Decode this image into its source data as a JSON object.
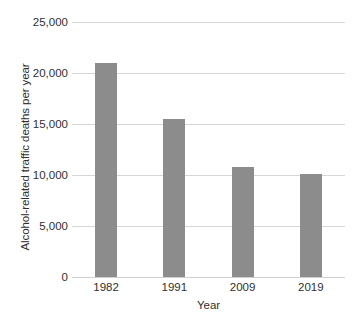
{
  "chart_data": {
    "type": "bar",
    "title": "",
    "subtitle": "",
    "xlabel": "Year",
    "ylabel": "Alcohol-related traffic deaths per year",
    "categories": [
      "1982",
      "1991",
      "2009",
      "2019"
    ],
    "values": [
      21000,
      15500,
      10800,
      10100
    ],
    "series": [
      {
        "name": "Alcohol-related traffic deaths per year",
        "values": [
          21000,
          15500,
          10800,
          10100
        ]
      }
    ],
    "ylim": [
      0,
      25000
    ],
    "ytick_values": [
      0,
      5000,
      10000,
      15000,
      20000,
      25000
    ],
    "ytick_labels": [
      "0",
      "5,000",
      "10,000",
      "15,000",
      "20,000",
      "25,000"
    ],
    "xtick_labels": [
      "1982",
      "1991",
      "2009",
      "2019"
    ],
    "grid": true,
    "grid_axis": "y",
    "legend": false,
    "legend_position": "none",
    "bar_color": "#8c8c8c",
    "gridline_color": "#d6d6d6",
    "background_color": "#ffffff",
    "text_color": "#2f2f2f",
    "annotations": []
  }
}
